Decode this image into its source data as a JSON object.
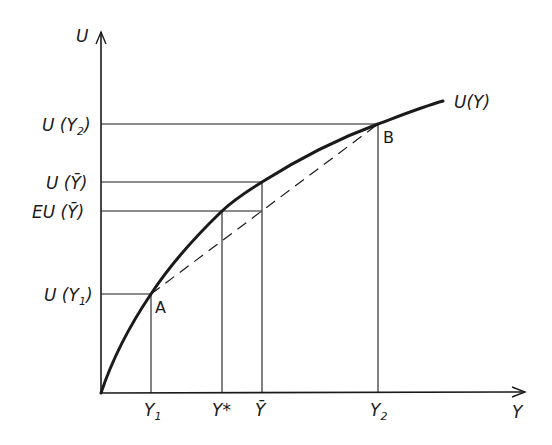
{
  "diagram": {
    "type": "expected-utility-risk-aversion",
    "axes": {
      "y_label": "U",
      "x_label": "Y"
    },
    "curve_label": "U(Y)",
    "points": [
      {
        "name": "A",
        "label": "A"
      },
      {
        "name": "B",
        "label": "B"
      }
    ],
    "y_ticks": [
      {
        "id": "u_y2",
        "main": "U (Y",
        "sub": "2",
        "close": ")"
      },
      {
        "id": "u_ybar",
        "main": "U (Ȳ)"
      },
      {
        "id": "eu_ybar",
        "main": "EU (Ȳ)"
      },
      {
        "id": "u_y1",
        "main": "U (Y",
        "sub": "1",
        "close": ")"
      }
    ],
    "x_ticks": [
      {
        "id": "y1",
        "main": "Y",
        "sub": "1"
      },
      {
        "id": "ystar",
        "main": "Y*"
      },
      {
        "id": "ybar",
        "main": "Ȳ"
      },
      {
        "id": "y2",
        "main": "Y",
        "sub": "2"
      }
    ],
    "colors": {
      "ink": "#1a1a1a",
      "background": "#ffffff"
    }
  }
}
